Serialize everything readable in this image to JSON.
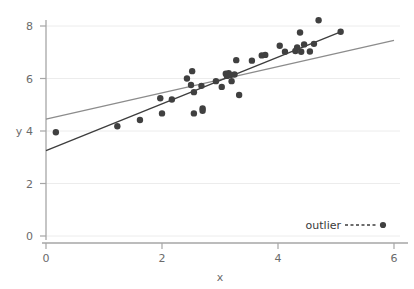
{
  "chart_data": {
    "type": "scatter",
    "title": "",
    "xlabel": "x",
    "ylabel": "y",
    "xlim": [
      0,
      6
    ],
    "ylim": [
      0,
      8.8
    ],
    "xticks": [
      0,
      2,
      4,
      6
    ],
    "yticks": [
      0,
      2,
      4,
      6,
      8
    ],
    "grid": "horizontal",
    "legend_position": "bottom-right",
    "legend": [
      {
        "label": "outlier",
        "marker": "filled-circle",
        "line": "dashed"
      }
    ],
    "series": [
      {
        "name": "points",
        "type": "scatter",
        "marker": "filled-circle",
        "color": "#404040",
        "points": [
          [
            0.17,
            3.95
          ],
          [
            1.23,
            4.18
          ],
          [
            1.62,
            4.42
          ],
          [
            1.97,
            5.25
          ],
          [
            2.0,
            4.67
          ],
          [
            2.17,
            5.2
          ],
          [
            2.43,
            6.0
          ],
          [
            2.5,
            5.75
          ],
          [
            2.52,
            6.28
          ],
          [
            2.55,
            5.48
          ],
          [
            2.55,
            4.67
          ],
          [
            2.68,
            5.72
          ],
          [
            2.7,
            4.86
          ],
          [
            2.7,
            4.77
          ],
          [
            2.93,
            5.9
          ],
          [
            3.03,
            5.68
          ],
          [
            3.1,
            6.18
          ],
          [
            3.12,
            6.1
          ],
          [
            3.15,
            6.2
          ],
          [
            3.18,
            6.13
          ],
          [
            3.2,
            5.9
          ],
          [
            3.25,
            6.15
          ],
          [
            3.28,
            6.7
          ],
          [
            3.33,
            5.37
          ],
          [
            3.55,
            6.68
          ],
          [
            3.72,
            6.88
          ],
          [
            3.78,
            6.9
          ],
          [
            4.03,
            7.25
          ],
          [
            4.12,
            7.02
          ],
          [
            4.3,
            7.05
          ],
          [
            4.33,
            7.18
          ],
          [
            4.38,
            7.75
          ],
          [
            4.4,
            7.02
          ],
          [
            4.45,
            7.3
          ],
          [
            4.55,
            7.03
          ],
          [
            4.62,
            7.32
          ],
          [
            4.7,
            8.22
          ],
          [
            5.08,
            7.78
          ]
        ]
      },
      {
        "name": "regression-all",
        "type": "line",
        "color": "#8c8c8c",
        "endpoints": [
          [
            0.0,
            4.45
          ],
          [
            6.0,
            7.45
          ]
        ]
      },
      {
        "name": "regression-excluding-outlier",
        "type": "line",
        "color": "#3d3d3d",
        "endpoints": [
          [
            0.0,
            3.25
          ],
          [
            5.08,
            7.78
          ]
        ]
      }
    ]
  },
  "legend": {
    "outlier_label": "outlier"
  },
  "axes": {
    "x_title": "x",
    "y_title": "y"
  },
  "colors": {
    "marker": "#404040",
    "line_gray": "#8c8c8c",
    "line_dark": "#3d3d3d",
    "grid": "#ececec",
    "axis": "#9a9a9a",
    "text": "#6b6b6b"
  }
}
